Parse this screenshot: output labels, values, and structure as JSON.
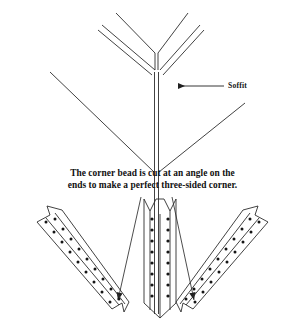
{
  "figure": {
    "background_color": "#ffffff",
    "line_color": "#2b2b2b",
    "dot_color": "#151515"
  },
  "annotations": {
    "soffit_label": "Soffit",
    "soffit_arrow": "left-arrow"
  },
  "caption": {
    "line1": "The corner bead is cut at an angle on the",
    "line2": "ends to make a perfect three-sided corner."
  },
  "top_view": {
    "name": "soffit-corner-assembly",
    "description": "Isometric three-sided inside corner formed by two soffit edges and a vertical wall corner",
    "members": [
      {
        "name": "upper-left-soffit-edge",
        "style": "double-line"
      },
      {
        "name": "upper-right-soffit-edge",
        "style": "double-line"
      },
      {
        "name": "upper-left-wall-line",
        "style": "single-line"
      },
      {
        "name": "upper-right-wall-line",
        "style": "single-line"
      },
      {
        "name": "vertical-corner-spine",
        "style": "double-line"
      },
      {
        "name": "lower-left-wall-edge",
        "style": "single-line"
      },
      {
        "name": "lower-right-wall-edge",
        "style": "single-line"
      }
    ]
  },
  "bead_pieces": [
    {
      "name": "left-corner-bead",
      "orientation": "diagonal-down-right",
      "end_cut": "angled-notch",
      "perforation_rows": 2,
      "perforations_per_row": 11
    },
    {
      "name": "center-corner-bead",
      "orientation": "vertical",
      "end_cut": "v-notch-top-point-bottom",
      "perforation_rows": 2,
      "perforations_per_row": 9
    },
    {
      "name": "right-corner-bead",
      "orientation": "diagonal-down-left",
      "end_cut": "angled-notch",
      "perforation_rows": 2,
      "perforations_per_row": 11
    }
  ],
  "leader_lines": [
    {
      "name": "leader-to-left-bead",
      "arrowhead": "down-left"
    },
    {
      "name": "leader-to-right-bead",
      "arrowhead": "down-right"
    }
  ]
}
